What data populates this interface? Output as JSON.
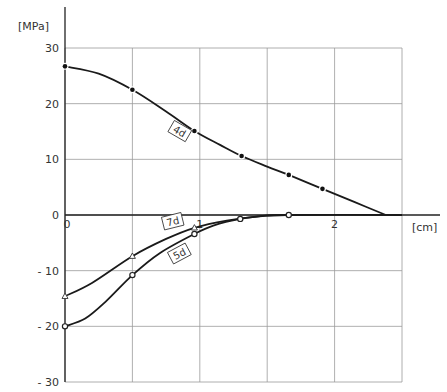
{
  "chart_data": {
    "type": "line",
    "title": "",
    "xlabel": "[cm]",
    "ylabel": "[MPa]",
    "xlim": [
      0,
      2.5
    ],
    "ylim": [
      -30,
      30
    ],
    "x_ticks": [
      {
        "value": 0,
        "label": "0"
      },
      {
        "value": 1,
        "label": "1"
      },
      {
        "value": 2,
        "label": "2"
      }
    ],
    "y_ticks": [
      {
        "value": 30,
        "label": "30"
      },
      {
        "value": 20,
        "label": "20"
      },
      {
        "value": 10,
        "label": "10"
      },
      {
        "value": 0,
        "label": "0"
      },
      {
        "value": -10,
        "label": "-10"
      },
      {
        "value": -20,
        "label": "-20"
      },
      {
        "value": -30,
        "label": "-30"
      }
    ],
    "grid": {
      "x_step": 0.5,
      "y_step": 10,
      "on": true
    },
    "series": [
      {
        "name": "4d",
        "marker": "filled-circle",
        "points": [
          [
            0,
            26.7
          ],
          [
            0.5,
            22.5
          ],
          [
            0.96,
            15.1
          ],
          [
            1.31,
            10.6
          ],
          [
            1.66,
            7.2
          ],
          [
            1.91,
            4.7
          ]
        ],
        "curve": [
          [
            0,
            26.7
          ],
          [
            0.25,
            25.4
          ],
          [
            0.5,
            22.5
          ],
          [
            0.75,
            18.6
          ],
          [
            0.96,
            15.1
          ],
          [
            1.15,
            12.6
          ],
          [
            1.31,
            10.6
          ],
          [
            1.5,
            8.7
          ],
          [
            1.66,
            7.2
          ],
          [
            1.91,
            4.7
          ],
          [
            2.15,
            2.3
          ],
          [
            2.38,
            0
          ]
        ],
        "label": {
          "text": "4d",
          "x": 0.85,
          "y": 15.0
        }
      },
      {
        "name": "7d",
        "marker": "open-triangle",
        "points": [
          [
            0,
            -14.6
          ],
          [
            0.5,
            -7.4
          ],
          [
            0.96,
            -2.3
          ]
        ],
        "curve": [
          [
            0,
            -14.6
          ],
          [
            0.2,
            -12.2
          ],
          [
            0.5,
            -7.4
          ],
          [
            0.75,
            -4.3
          ],
          [
            0.96,
            -2.3
          ],
          [
            1.2,
            -1.0
          ],
          [
            1.45,
            -0.2
          ],
          [
            1.66,
            0
          ],
          [
            2.5,
            0
          ]
        ],
        "label": {
          "text": "7d",
          "x": 0.8,
          "y": -1.2
        }
      },
      {
        "name": "5d",
        "marker": "open-circle",
        "points": [
          [
            0,
            -20.0
          ],
          [
            0.5,
            -10.8
          ],
          [
            0.96,
            -3.4
          ],
          [
            1.3,
            -0.7
          ],
          [
            1.66,
            0
          ]
        ],
        "curve": [
          [
            0,
            -20.0
          ],
          [
            0.15,
            -18.6
          ],
          [
            0.3,
            -15.6
          ],
          [
            0.5,
            -10.8
          ],
          [
            0.7,
            -6.9
          ],
          [
            0.96,
            -3.4
          ],
          [
            1.1,
            -1.9
          ],
          [
            1.3,
            -0.7
          ],
          [
            1.5,
            -0.1
          ],
          [
            1.66,
            0
          ]
        ],
        "label": {
          "text": "5d",
          "x": 0.85,
          "y": -7.0
        }
      }
    ]
  }
}
